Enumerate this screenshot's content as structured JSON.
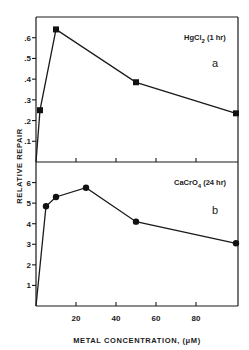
{
  "chart_data": {
    "type": "line",
    "ylabel": "RELATIVE REPAIR",
    "xlabel": "METAL CONCENTRATION, (μM)",
    "xlim": [
      0,
      100
    ],
    "xticks": [
      20,
      40,
      60,
      80
    ],
    "xtick_labels": [
      "20",
      "40",
      "60",
      "80"
    ],
    "grid": false,
    "panels": [
      {
        "id": "a",
        "panel_label": "a",
        "annotation": "HgCl",
        "annotation_sub": "2",
        "annotation_suffix": " (1 hr)",
        "ylim": [
          0,
          0.7
        ],
        "yticks": [
          0.1,
          0.2,
          0.3,
          0.4,
          0.5,
          0.6
        ],
        "ytick_labels": [
          ".1",
          ".2",
          ".3",
          ".4",
          ".5",
          ".6"
        ],
        "marker": "square",
        "series": [
          {
            "name": "HgCl2 (1 hr)",
            "x": [
              0,
              2,
              10,
              50,
              100
            ],
            "y": [
              0,
              0.25,
              0.64,
              0.385,
              0.235
            ]
          }
        ]
      },
      {
        "id": "b",
        "panel_label": "b",
        "annotation": "CaCrO",
        "annotation_sub": "4",
        "annotation_suffix": " (24 hr)",
        "ylim": [
          0,
          7
        ],
        "yticks": [
          1,
          2,
          3,
          4,
          5,
          6
        ],
        "ytick_labels": [
          "1",
          "2",
          "3",
          "4",
          "5",
          "6"
        ],
        "marker": "circle",
        "series": [
          {
            "name": "CaCrO4 (24 hr)",
            "x": [
              0,
              5,
              10,
              25,
              50,
              100
            ],
            "y": [
              0,
              4.85,
              5.3,
              5.75,
              4.1,
              3.05
            ]
          }
        ]
      }
    ]
  }
}
